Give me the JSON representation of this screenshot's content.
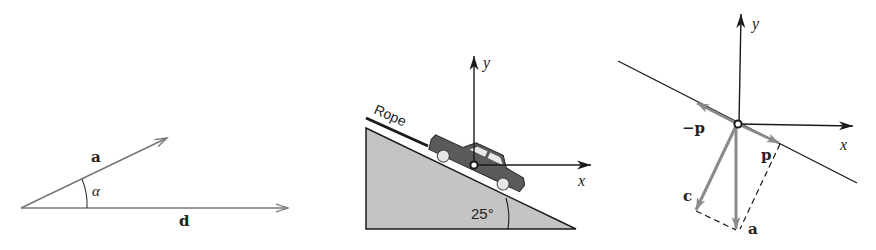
{
  "figure": {
    "panels": [
      {
        "id": "vector-angle",
        "vectors": [
          {
            "name": "a",
            "label": "a"
          },
          {
            "name": "d",
            "label": "d"
          }
        ],
        "angle_label": "α"
      },
      {
        "id": "car-on-incline",
        "rope_label": "Rope",
        "incline_angle_label": "25°",
        "axes": {
          "x_label": "x",
          "y_label": "y"
        }
      },
      {
        "id": "vector-decomposition",
        "axes": {
          "x_label": "x",
          "y_label": "y"
        },
        "vectors": [
          {
            "name": "p",
            "label": "p"
          },
          {
            "name": "neg-p",
            "label": "−p"
          },
          {
            "name": "a",
            "label": "a"
          },
          {
            "name": "c",
            "label": "c"
          }
        ]
      }
    ],
    "colors": {
      "line": "#1a1a1a",
      "vector_gray": "#8a8a8a",
      "incline_fill": "#c4c4c4",
      "car_body": "#5a5a5a"
    }
  }
}
